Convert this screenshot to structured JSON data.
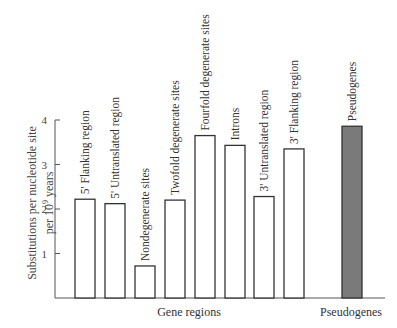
{
  "chart_data": {
    "type": "bar",
    "title": "",
    "ylabel": "Substitutions per nucleotide site per 10^9 years",
    "ylabel_line1": "Substitutions per nucleotide site",
    "ylabel_line2": "per 10",
    "ylabel_sup": "9",
    "ylabel_line2_tail": " years",
    "ylim": [
      0,
      4
    ],
    "yticks": [
      1,
      2,
      3,
      4
    ],
    "grid": false,
    "groups": [
      {
        "label": "Gene regions"
      },
      {
        "label": "Pseudogenes"
      }
    ],
    "categories": [
      "5' Flanking region",
      "5' Untranslated region",
      "Nondegenerate sites",
      "Twofold degenerate sites",
      "Fourfold degenerate sites",
      "Introns",
      "3' Untranslated region",
      "3' Flanking region",
      "Pseudogenes"
    ],
    "values": [
      2.22,
      2.12,
      0.72,
      2.2,
      3.65,
      3.43,
      2.28,
      3.35,
      3.86
    ],
    "group_of": [
      "Gene regions",
      "Gene regions",
      "Gene regions",
      "Gene regions",
      "Gene regions",
      "Gene regions",
      "Gene regions",
      "Gene regions",
      "Pseudogenes"
    ],
    "colors": {
      "gene_bar_fill": "#ffffff",
      "pseudogene_bar_fill": "#7a7a7a",
      "stroke": "#333333"
    }
  }
}
